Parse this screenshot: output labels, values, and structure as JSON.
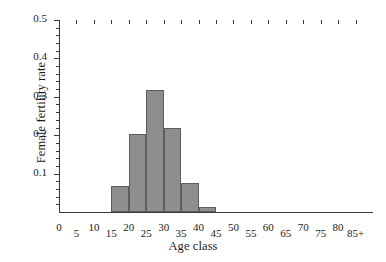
{
  "chart_data": {
    "type": "bar",
    "title": "",
    "xlabel": "Age class",
    "ylabel": "Female fertility rate",
    "categories": [
      "0",
      "5",
      "10",
      "15",
      "20",
      "25",
      "30",
      "35",
      "40",
      "45",
      "50",
      "55",
      "60",
      "65",
      "70",
      "75",
      "80",
      "85+"
    ],
    "bars": [
      {
        "x_start": 15,
        "x_end": 20,
        "label": "15",
        "value": 0.068
      },
      {
        "x_start": 20,
        "x_end": 25,
        "label": "20",
        "value": 0.203
      },
      {
        "x_start": 25,
        "x_end": 30,
        "label": "25",
        "value": 0.317
      },
      {
        "x_start": 30,
        "x_end": 35,
        "label": "30",
        "value": 0.218
      },
      {
        "x_start": 35,
        "x_end": 40,
        "label": "35",
        "value": 0.075
      },
      {
        "x_start": 40,
        "x_end": 45,
        "label": "40",
        "value": 0.013
      }
    ],
    "values": [
      0,
      0,
      0,
      0.068,
      0.203,
      0.317,
      0.218,
      0.075,
      0.013,
      0,
      0,
      0,
      0,
      0,
      0,
      0,
      0,
      0
    ],
    "xlim": [
      0,
      90
    ],
    "ylim": [
      0,
      0.5
    ],
    "y_major_ticks": [
      "0.1",
      "0.2",
      "0.3",
      "0.4",
      "0.5"
    ],
    "y_major_values": [
      0.1,
      0.2,
      0.3,
      0.4,
      0.5
    ],
    "y_minor_interval": 0.02,
    "x_tick_values": [
      0,
      5,
      10,
      15,
      20,
      25,
      30,
      35,
      40,
      45,
      50,
      55,
      60,
      65,
      70,
      75,
      80,
      85
    ],
    "grid": false,
    "legend": null,
    "bar_color": "#8e8e8e",
    "bar_edge_color": "#5d5d5d",
    "axis_color": "#3a3a3a"
  }
}
